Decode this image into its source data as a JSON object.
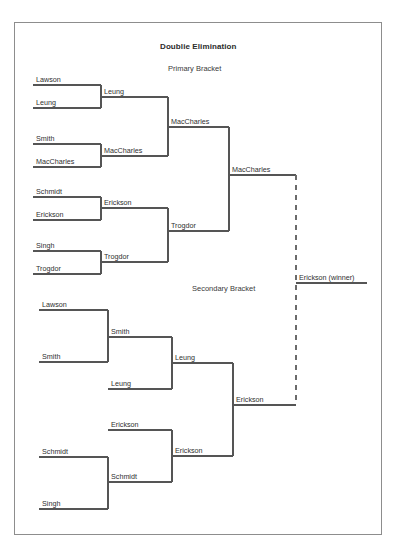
{
  "document": {
    "title": "Doublie Elimination",
    "primary_section_label": "Primary Bracket",
    "secondary_section_label": "Secondary Bracket",
    "winner_label": "Erickson (winner)"
  },
  "colors": {
    "line": "#555555",
    "dashed_line": "#6b6b6b",
    "page_border": "#8d8d8d",
    "text": "#2f2f2f",
    "background": "#ffffff"
  },
  "primary_bracket": {
    "round1": [
      {
        "id": "p-r1-m1-a",
        "label": "Lawson"
      },
      {
        "id": "p-r1-m1-b",
        "label": "Leung"
      },
      {
        "id": "p-r1-m2-a",
        "label": "Smith"
      },
      {
        "id": "p-r1-m2-b",
        "label": "MacCharles"
      },
      {
        "id": "p-r1-m3-a",
        "label": "Schmidt"
      },
      {
        "id": "p-r1-m3-b",
        "label": "Erickson"
      },
      {
        "id": "p-r1-m4-a",
        "label": "Singh"
      },
      {
        "id": "p-r1-m4-b",
        "label": "Trogdor"
      }
    ],
    "round2": [
      {
        "id": "p-r2-m1",
        "label": "Leung"
      },
      {
        "id": "p-r2-m2",
        "label": "MacCharles"
      },
      {
        "id": "p-r2-m3",
        "label": "Erickson"
      },
      {
        "id": "p-r2-m4",
        "label": "Trogdor"
      }
    ],
    "round3": [
      {
        "id": "p-r3-m1",
        "label": "MacCharles"
      },
      {
        "id": "p-r3-m2",
        "label": "Trogdor"
      }
    ],
    "final": [
      {
        "id": "p-r4-m1",
        "label": "MacCharles"
      }
    ]
  },
  "secondary_bracket": {
    "round1": [
      {
        "id": "s-r1-m1-a",
        "label": "Lawson"
      },
      {
        "id": "s-r1-m1-b",
        "label": "Smith"
      },
      {
        "id": "s-r1-m2-a",
        "label": "Schmidt"
      },
      {
        "id": "s-r1-m2-b",
        "label": "Singh"
      }
    ],
    "round2": [
      {
        "id": "s-r2-m1",
        "label": "Smith"
      },
      {
        "id": "s-r2-m2",
        "label": "Leung"
      },
      {
        "id": "s-r2-m3",
        "label": "Erickson"
      },
      {
        "id": "s-r2-m4",
        "label": "Schmidt"
      }
    ],
    "round3": [
      {
        "id": "s-r3-m1",
        "label": "Leung"
      },
      {
        "id": "s-r3-m2",
        "label": "Erickson"
      }
    ],
    "final": [
      {
        "id": "s-r4-m1",
        "label": "Erickson"
      }
    ]
  }
}
